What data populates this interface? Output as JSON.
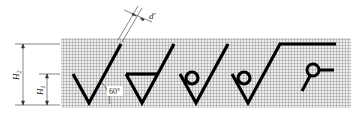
{
  "diagram": {
    "labels": {
      "h2": "H",
      "h2_sub": "2",
      "h1": "H",
      "h1_sub": "1",
      "d": "d'",
      "angle": "60°"
    },
    "symbols": [
      {
        "name": "basic-check-symbol"
      },
      {
        "name": "material-removal-symbol"
      },
      {
        "name": "no-material-removal-symbol"
      },
      {
        "name": "extended-no-removal-symbol"
      },
      {
        "name": "circle-with-tail-symbol"
      }
    ],
    "colors": {
      "grid_line": "#555555",
      "grid_bg": "#e6e6e6",
      "stroke": "#000000"
    }
  }
}
